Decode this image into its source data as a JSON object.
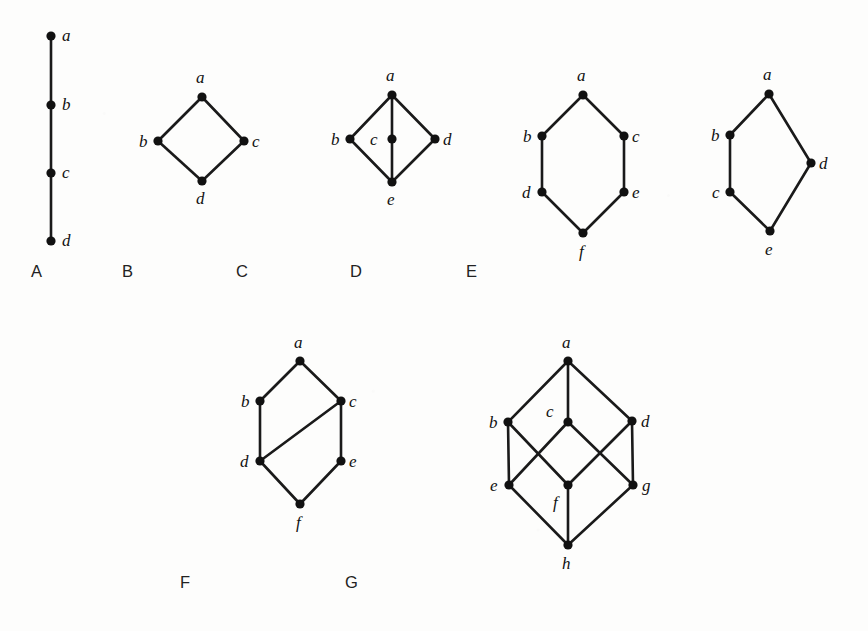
{
  "figure": {
    "background_color": "#fdfdfc",
    "ink_color": "#111111",
    "caption_color": "#222222"
  },
  "graphs": [
    {
      "caption": "A",
      "caption_pos": [
        31,
        277
      ],
      "vertices": [
        {
          "id": "a",
          "label": "a",
          "x": 51,
          "y": 36,
          "label_x": 62,
          "label_y": 41
        },
        {
          "id": "b",
          "label": "b",
          "x": 51,
          "y": 105,
          "label_x": 62,
          "label_y": 110
        },
        {
          "id": "c",
          "label": "c",
          "x": 51,
          "y": 173,
          "label_x": 62,
          "label_y": 178
        },
        {
          "id": "d",
          "label": "d",
          "x": 51,
          "y": 241,
          "label_x": 62,
          "label_y": 246
        }
      ],
      "edges": [
        [
          "a",
          "b"
        ],
        [
          "b",
          "c"
        ],
        [
          "c",
          "d"
        ]
      ]
    },
    {
      "caption": "B",
      "caption_pos": [
        122,
        277
      ],
      "vertices": [
        {
          "id": "a",
          "label": "a",
          "x": 202,
          "y": 97,
          "label_x": 196,
          "label_y": 83
        },
        {
          "id": "b",
          "label": "b",
          "x": 158,
          "y": 141,
          "label_x": 139,
          "label_y": 147
        },
        {
          "id": "c",
          "label": "c",
          "x": 244,
          "y": 141,
          "label_x": 252,
          "label_y": 147
        },
        {
          "id": "d",
          "label": "d",
          "x": 202,
          "y": 181,
          "label_x": 196,
          "label_y": 204
        }
      ],
      "edges": [
        [
          "a",
          "b"
        ],
        [
          "a",
          "c"
        ],
        [
          "b",
          "d"
        ],
        [
          "c",
          "d"
        ]
      ]
    },
    {
      "caption": "C",
      "caption_pos": [
        236,
        277
      ],
      "vertices": [
        {
          "id": "a",
          "label": "a",
          "x": 392,
          "y": 95,
          "label_x": 386,
          "label_y": 81
        },
        {
          "id": "b",
          "label": "b",
          "x": 350,
          "y": 139,
          "label_x": 331,
          "label_y": 145
        },
        {
          "id": "c",
          "label": "c",
          "x": 392,
          "y": 139,
          "label_x": 370,
          "label_y": 145
        },
        {
          "id": "d",
          "label": "d",
          "x": 435,
          "y": 139,
          "label_x": 443,
          "label_y": 145
        },
        {
          "id": "e",
          "label": "e",
          "x": 392,
          "y": 182,
          "label_x": 387,
          "label_y": 205
        }
      ],
      "edges": [
        [
          "a",
          "b"
        ],
        [
          "a",
          "c"
        ],
        [
          "a",
          "d"
        ],
        [
          "b",
          "e"
        ],
        [
          "c",
          "e"
        ],
        [
          "d",
          "e"
        ]
      ]
    },
    {
      "caption": "D",
      "caption_pos": [
        350,
        277
      ],
      "vertices": [
        {
          "id": "a",
          "label": "a",
          "x": 583,
          "y": 95,
          "label_x": 577,
          "label_y": 81
        },
        {
          "id": "b",
          "label": "b",
          "x": 542,
          "y": 136,
          "label_x": 523,
          "label_y": 142
        },
        {
          "id": "c",
          "label": "c",
          "x": 624,
          "y": 136,
          "label_x": 632,
          "label_y": 142
        },
        {
          "id": "d",
          "label": "d",
          "x": 542,
          "y": 192,
          "label_x": 522,
          "label_y": 198
        },
        {
          "id": "e",
          "label": "e",
          "x": 624,
          "y": 192,
          "label_x": 632,
          "label_y": 198
        },
        {
          "id": "f",
          "label": "f",
          "x": 583,
          "y": 233,
          "label_x": 579,
          "label_y": 257
        }
      ],
      "edges": [
        [
          "a",
          "b"
        ],
        [
          "a",
          "c"
        ],
        [
          "b",
          "d"
        ],
        [
          "c",
          "e"
        ],
        [
          "d",
          "f"
        ],
        [
          "e",
          "f"
        ]
      ]
    },
    {
      "caption": "E",
      "caption_pos": [
        466,
        277
      ],
      "vertices": [
        {
          "id": "a",
          "label": "a",
          "x": 769,
          "y": 94,
          "label_x": 763,
          "label_y": 80
        },
        {
          "id": "b",
          "label": "b",
          "x": 730,
          "y": 135,
          "label_x": 711,
          "label_y": 141
        },
        {
          "id": "c",
          "label": "c",
          "x": 730,
          "y": 192,
          "label_x": 712,
          "label_y": 198
        },
        {
          "id": "d",
          "label": "d",
          "x": 811,
          "y": 163,
          "label_x": 819,
          "label_y": 169
        },
        {
          "id": "e",
          "label": "e",
          "x": 770,
          "y": 231,
          "label_x": 765,
          "label_y": 255
        }
      ],
      "edges": [
        [
          "a",
          "b"
        ],
        [
          "a",
          "d"
        ],
        [
          "b",
          "c"
        ],
        [
          "c",
          "e"
        ],
        [
          "d",
          "e"
        ]
      ]
    },
    {
      "caption": "F",
      "caption_pos": [
        180,
        588
      ],
      "vertices": [
        {
          "id": "a",
          "label": "a",
          "x": 300,
          "y": 361,
          "label_x": 294,
          "label_y": 348
        },
        {
          "id": "b",
          "label": "b",
          "x": 260,
          "y": 401,
          "label_x": 241,
          "label_y": 407
        },
        {
          "id": "c",
          "label": "c",
          "x": 341,
          "y": 401,
          "label_x": 349,
          "label_y": 407
        },
        {
          "id": "d",
          "label": "d",
          "x": 260,
          "y": 461,
          "label_x": 240,
          "label_y": 467
        },
        {
          "id": "e",
          "label": "e",
          "x": 341,
          "y": 461,
          "label_x": 349,
          "label_y": 467
        },
        {
          "id": "f",
          "label": "f",
          "x": 300,
          "y": 504,
          "label_x": 296,
          "label_y": 528
        }
      ],
      "edges": [
        [
          "a",
          "b"
        ],
        [
          "a",
          "c"
        ],
        [
          "b",
          "d"
        ],
        [
          "c",
          "d"
        ],
        [
          "c",
          "e"
        ],
        [
          "d",
          "f"
        ],
        [
          "e",
          "f"
        ]
      ]
    },
    {
      "caption": "G",
      "caption_pos": [
        345,
        588
      ],
      "vertices": [
        {
          "id": "a",
          "label": "a",
          "x": 568,
          "y": 361,
          "label_x": 562,
          "label_y": 348
        },
        {
          "id": "b",
          "label": "b",
          "x": 508,
          "y": 422,
          "label_x": 489,
          "label_y": 428
        },
        {
          "id": "c",
          "label": "c",
          "x": 568,
          "y": 422,
          "label_x": 546,
          "label_y": 417
        },
        {
          "id": "d",
          "label": "d",
          "x": 632,
          "y": 421,
          "label_x": 641,
          "label_y": 427
        },
        {
          "id": "e",
          "label": "e",
          "x": 509,
          "y": 485,
          "label_x": 490,
          "label_y": 491
        },
        {
          "id": "f",
          "label": "f",
          "x": 568,
          "y": 485,
          "label_x": 553,
          "label_y": 508
        },
        {
          "id": "g",
          "label": "g",
          "x": 633,
          "y": 485,
          "label_x": 642,
          "label_y": 491
        },
        {
          "id": "h",
          "label": "h",
          "x": 568,
          "y": 545,
          "label_x": 562,
          "label_y": 569
        }
      ],
      "edges": [
        [
          "a",
          "b"
        ],
        [
          "a",
          "c"
        ],
        [
          "a",
          "d"
        ],
        [
          "b",
          "e"
        ],
        [
          "b",
          "f"
        ],
        [
          "c",
          "e"
        ],
        [
          "c",
          "g"
        ],
        [
          "d",
          "f"
        ],
        [
          "d",
          "g"
        ],
        [
          "e",
          "h"
        ],
        [
          "f",
          "h"
        ],
        [
          "g",
          "h"
        ]
      ]
    }
  ]
}
